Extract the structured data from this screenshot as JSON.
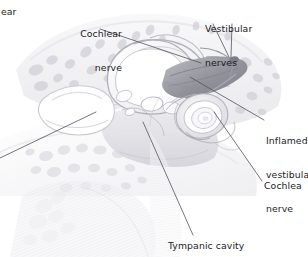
{
  "figure": {
    "style": "grayscale medical illustration",
    "background_color": "#ffffff",
    "ink_color": "#1b1b1f",
    "leader_line_color": "#4a4a52",
    "bone_tone": "#d9d9de",
    "shadow_tone": "#9a9aa2",
    "inflamed_tone": "#8a8a92"
  },
  "labels": {
    "ear_partial": "ear",
    "cochlear_nerve": "Cochlear\nnerve",
    "cochlear_nerve_line1": "Cochlear",
    "cochlear_nerve_line2": "nerve",
    "vestibular_nerves": "Vestibular\nnerves",
    "vestibular_nerves_line1": "Vestibular",
    "vestibular_nerves_line2": "nerves",
    "inflamed_vestibular_nerve": "Inflamed\nvestibular\nnerve",
    "inflamed_line1": "Inflamed",
    "inflamed_line2": "vestibular",
    "inflamed_line3": "nerve",
    "cochlea": "Cochlea",
    "tympanic_cavity": "Tympanic cavity"
  },
  "structures": [
    {
      "name": "semicircular-canals",
      "label": "Vestibular nerves"
    },
    {
      "name": "cochlea-spiral",
      "label": "Cochlea"
    },
    {
      "name": "inflamed-vestibular-nerve",
      "label": "Inflamed vestibular nerve"
    },
    {
      "name": "cochlear-nerve",
      "label": "Cochlear nerve"
    },
    {
      "name": "tympanic-cavity",
      "label": "Tympanic cavity"
    },
    {
      "name": "mastoid-air-cells",
      "label": ""
    }
  ]
}
